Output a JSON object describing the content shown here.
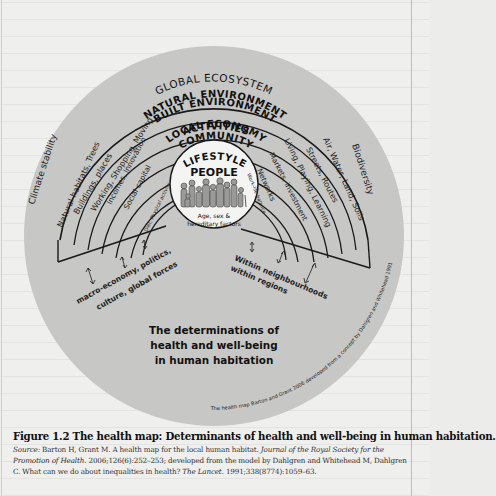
{
  "diagram": {
    "title": "The health map",
    "outer_ring_label": "GLOBAL ECOSYSTEM",
    "rings": [
      {
        "name": "NATURAL ENVIRONMENT",
        "left_label": "Natural habitats, Trees",
        "right_label": "Air, Water, Land, Soils"
      },
      {
        "name": "BUILT ENVIRONMENT",
        "left_label": "Buildings, places",
        "right_label": "Streets, Routes"
      },
      {
        "name": "ACTIVITIES",
        "left_label": "Working, Shopping, Moving",
        "right_label": "Living, Playing, Learning"
      },
      {
        "name": "LOCAL ECONOMY",
        "left_label": "Incomes, Innovation",
        "right_label": "Markets, investment"
      },
      {
        "name": "COMMUNITY",
        "left_label": "Social capital",
        "right_label": "Networks"
      },
      {
        "name": "LIFESTYLE",
        "left_label": "Diet, Physical activity",
        "right_label": "Work-life balance"
      }
    ],
    "center": {
      "title": "PEOPLE",
      "subtitle_line1": "Age, sex &",
      "subtitle_line2": "hereditary factors"
    },
    "outer_left_label": "Climate stability",
    "outer_right_label": "Biodiversity",
    "left_wedge_label_line1": "macro-economy, politics,",
    "left_wedge_label_line2": "culture, global forces",
    "right_wedge_label_line1": "Within neighbourhoods",
    "right_wedge_label_line2": "within regions",
    "main_text_line1": "The determinations of",
    "main_text_line2": "health and well-being",
    "main_text_line3": "in human habitation",
    "credit": "The health map Barton and Grant 2006 developed from a concept by Dahlgren and Whitehead 1991",
    "colors": {
      "disc": "#c7c7c5",
      "inner_disc": "#d2d2d0",
      "people_circle": "#f4f4f2",
      "lines": "#1a1a1a",
      "page": "#efefed"
    }
  },
  "caption": {
    "figure_label": "Figure 1.2",
    "figure_title": "The health map: Determinants of health and well-being in human habitation.",
    "source_label": "Source:",
    "source_text_1": " Barton H, Grant M. A health map for the local human habitat. ",
    "source_journal": "Journal of the Royal Society for the Promotion of Health",
    "source_text_2": ". 2006;126(6):252–253; developed from the model by Dahlgren and Whitehead M, Dahlgren C. What can we do about inequalities in health? ",
    "source_journal_2": "The Lancet",
    "source_text_3": ". 1991;338(8774):1059–63."
  }
}
